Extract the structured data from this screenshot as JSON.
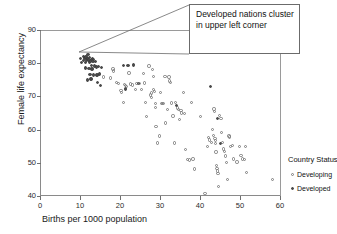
{
  "chart_data": {
    "type": "scatter",
    "title": "",
    "xlabel": "Births per 1000 population",
    "ylabel": "Female life expectancy",
    "xlim": [
      0,
      60
    ],
    "ylim": [
      40,
      90
    ],
    "xticks": [
      0,
      10,
      20,
      30,
      40,
      50,
      60
    ],
    "yticks": [
      40,
      50,
      60,
      70,
      80,
      90
    ],
    "grid": false,
    "legend": {
      "title": "Country Status",
      "position": "right",
      "entries": [
        {
          "label": "Developing",
          "marker": "open-circle"
        },
        {
          "label": "Developed",
          "marker": "filled-dot"
        }
      ]
    },
    "annotations": [
      {
        "text": "Developed nations cluster in upper left corner",
        "target_x": 12,
        "target_y": 82
      }
    ],
    "series": [
      {
        "name": "Developed",
        "marker": "filled-dot",
        "color": "#4a4a4a",
        "points": [
          [
            10.1,
            81.4
          ],
          [
            10.4,
            80.3
          ],
          [
            10.8,
            82.0
          ],
          [
            10.9,
            80.8
          ],
          [
            11.2,
            81.6
          ],
          [
            11.3,
            80.2
          ],
          [
            11.5,
            81.9
          ],
          [
            11.6,
            80.9
          ],
          [
            11.8,
            81.3
          ],
          [
            12.0,
            82.6
          ],
          [
            12.1,
            81.0
          ],
          [
            12.3,
            80.4
          ],
          [
            12.4,
            81.7
          ],
          [
            12.6,
            80.7
          ],
          [
            12.8,
            81.2
          ],
          [
            12.9,
            79.4
          ],
          [
            13.1,
            81.5
          ],
          [
            13.2,
            80.6
          ],
          [
            13.4,
            81.1
          ],
          [
            13.6,
            79.2
          ],
          [
            13.8,
            80.5
          ],
          [
            11.4,
            78.6
          ],
          [
            12.2,
            78.4
          ],
          [
            13.0,
            78.3
          ],
          [
            14.1,
            78.8
          ],
          [
            14.6,
            79.0
          ],
          [
            15.3,
            78.7
          ],
          [
            12.5,
            76.6
          ],
          [
            13.3,
            76.4
          ],
          [
            14.2,
            76.5
          ],
          [
            14.9,
            76.7
          ],
          [
            11.9,
            75.0
          ],
          [
            12.7,
            75.2
          ],
          [
            14.4,
            74.1
          ],
          [
            15.1,
            73.2
          ],
          [
            20.9,
            79.4
          ],
          [
            22.0,
            79.3
          ],
          [
            23.4,
            79.5
          ],
          [
            21.3,
            72.2
          ],
          [
            24.6,
            73.8
          ],
          [
            34.1,
            67.2
          ],
          [
            42.6,
            72.9
          ],
          [
            44.4,
            63.4
          ],
          [
            45.1,
            55.8
          ]
        ]
      },
      {
        "name": "Developing",
        "marker": "open-circle",
        "color": "#7d7d7d",
        "points": [
          [
            15.8,
            75.8
          ],
          [
            17.6,
            75.5
          ],
          [
            18.2,
            78.3
          ],
          [
            18.3,
            77.7
          ],
          [
            19.1,
            74.2
          ],
          [
            19.6,
            73.9
          ],
          [
            20.2,
            71.8
          ],
          [
            20.4,
            71.2
          ],
          [
            20.8,
            68.1
          ],
          [
            21.1,
            73.6
          ],
          [
            21.4,
            73.3
          ],
          [
            21.6,
            72.9
          ],
          [
            22.2,
            77.0
          ],
          [
            22.6,
            73.7
          ],
          [
            23.1,
            73.4
          ],
          [
            23.8,
            72.1
          ],
          [
            24.2,
            73.9
          ],
          [
            24.9,
            73.8
          ],
          [
            25.4,
            72.1
          ],
          [
            25.8,
            76.9
          ],
          [
            26.1,
            74.0
          ],
          [
            26.3,
            68.2
          ],
          [
            26.6,
            64.0
          ],
          [
            27.2,
            79.2
          ],
          [
            27.6,
            70.4
          ],
          [
            27.8,
            69.7
          ],
          [
            27.9,
            71.0
          ],
          [
            28.1,
            78.1
          ],
          [
            28.3,
            76.0
          ],
          [
            28.4,
            72.0
          ],
          [
            28.6,
            71.4
          ],
          [
            28.8,
            67.9
          ],
          [
            28.9,
            66.6
          ],
          [
            29.0,
            61.0
          ],
          [
            29.3,
            56.0
          ],
          [
            29.8,
            58.1
          ],
          [
            30.1,
            71.2
          ],
          [
            30.4,
            67.8
          ],
          [
            30.6,
            67.9
          ],
          [
            30.9,
            67.8
          ],
          [
            31.2,
            76.0
          ],
          [
            31.4,
            62.0
          ],
          [
            31.8,
            66.0
          ],
          [
            32.2,
            75.9
          ],
          [
            32.4,
            74.6
          ],
          [
            32.6,
            74.2
          ],
          [
            32.9,
            68.0
          ],
          [
            33.2,
            64.1
          ],
          [
            33.6,
            56.0
          ],
          [
            33.9,
            68.2
          ],
          [
            34.3,
            66.5
          ],
          [
            34.6,
            66.0
          ],
          [
            34.8,
            63.1
          ],
          [
            35.2,
            65.8
          ],
          [
            35.4,
            65.0
          ],
          [
            35.8,
            71.2
          ],
          [
            36.1,
            64.8
          ],
          [
            36.4,
            54.1
          ],
          [
            36.9,
            51.0
          ],
          [
            37.4,
            50.9
          ],
          [
            37.8,
            68.2
          ],
          [
            38.2,
            51.2
          ],
          [
            38.6,
            48.1
          ],
          [
            40.1,
            63.9
          ],
          [
            41.2,
            40.8
          ],
          [
            41.9,
            55.0
          ],
          [
            42.1,
            57.6
          ],
          [
            42.4,
            56.9
          ],
          [
            42.8,
            56.2
          ],
          [
            43.1,
            60.1
          ],
          [
            43.3,
            58.3
          ],
          [
            43.5,
            66.2
          ],
          [
            43.6,
            65.4
          ],
          [
            43.7,
            57.4
          ],
          [
            43.8,
            56.7
          ],
          [
            43.9,
            55.9
          ],
          [
            44.0,
            53.3
          ],
          [
            44.1,
            49.1
          ],
          [
            44.2,
            48.3
          ],
          [
            44.3,
            47.5
          ],
          [
            44.5,
            46.7
          ],
          [
            44.6,
            42.8
          ],
          [
            44.8,
            64.3
          ],
          [
            45.2,
            63.3
          ],
          [
            45.4,
            59.2
          ],
          [
            45.6,
            56.1
          ],
          [
            45.8,
            54.2
          ],
          [
            46.1,
            53.4
          ],
          [
            46.3,
            52.1
          ],
          [
            46.6,
            50.1
          ],
          [
            46.8,
            45.0
          ],
          [
            47.2,
            58.1
          ],
          [
            47.4,
            57.8
          ],
          [
            47.6,
            54.9
          ],
          [
            48.1,
            55.2
          ],
          [
            48.4,
            51.2
          ],
          [
            49.2,
            50.2
          ],
          [
            49.8,
            55.0
          ],
          [
            50.2,
            52.2
          ],
          [
            50.6,
            51.1
          ],
          [
            51.1,
            51.0
          ],
          [
            51.4,
            55.0
          ],
          [
            51.6,
            47.0
          ],
          [
            58.1,
            45.0
          ]
        ]
      }
    ]
  }
}
